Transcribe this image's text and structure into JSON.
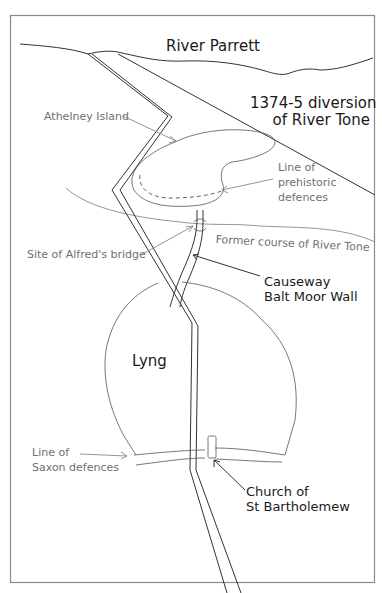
{
  "map": {
    "labels": {
      "river_parrett": "River Parrett",
      "diversion_line1": "1374-5 diversion",
      "diversion_line2": "of River Tone",
      "athelney_island": "Athelney Island",
      "prehistoric_line1": "Line of",
      "prehistoric_line2": "prehistoric",
      "prehistoric_line3": "defences",
      "alfreds_bridge": "Site of Alfred's bridge",
      "former_tone": "Former course of River Tone",
      "causeway_line1": "Causeway",
      "causeway_line2": "Balt Moor Wall",
      "lyng": "Lyng",
      "saxon_line1": "Line of",
      "saxon_line2": "Saxon defences",
      "church_line1": "Church of",
      "church_line2": "St Bartholemew"
    },
    "colors": {
      "dark_label": "#1a1a1a",
      "light_label": "#707070",
      "line": "#333333",
      "frame": "#8a8a8a"
    }
  }
}
